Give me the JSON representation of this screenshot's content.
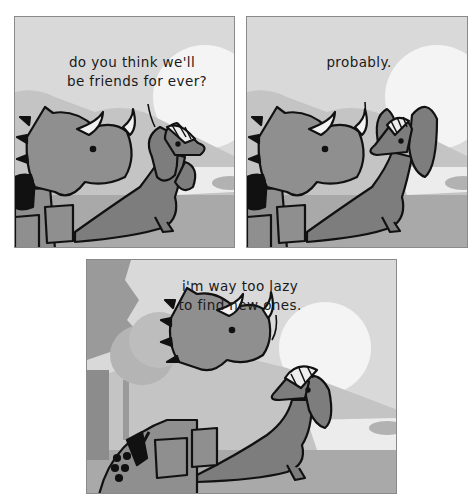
{
  "comic": {
    "panels": [
      {
        "id": 1,
        "speaker": "triceratops",
        "caption_lines": [
          "do you think we'll",
          "be friends for ever?"
        ]
      },
      {
        "id": 2,
        "speaker": "parasaurolophus",
        "caption_lines": [
          "probably."
        ]
      },
      {
        "id": 3,
        "speaker": "parasaurolophus",
        "caption_lines": [
          "i'm way too lazy",
          "to find new ones."
        ]
      }
    ],
    "colors": {
      "sky": "#d9d9d9",
      "sun": "#f4f4f4",
      "hills": "#bdbdbd",
      "water": "#ececec",
      "ground": "#a9a9a9",
      "triceratops": "#8f8f8f",
      "parasaurolophus": "#7d7d7d",
      "outline": "#111111",
      "tree_dark": "#8c8c8c",
      "tree_light": "#b4b4b4"
    }
  }
}
